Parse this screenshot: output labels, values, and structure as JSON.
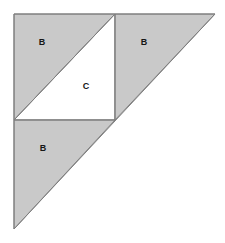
{
  "figure": {
    "type": "geometry-diagram",
    "canvas": {
      "width": 225,
      "height": 243
    },
    "colors": {
      "background": "#ffffff",
      "shaded_fill": "#c9c9c9",
      "unshaded_fill": "#ffffff",
      "stroke": "#7f7f7f",
      "label_text": "#161616"
    },
    "outer_triangle": {
      "vertices": [
        [
          14,
          14
        ],
        [
          215,
          14
        ],
        [
          14,
          229
        ]
      ],
      "right_angle_at": [
        14,
        14
      ]
    },
    "inner_square": {
      "corners": [
        [
          14,
          14
        ],
        [
          115,
          14
        ],
        [
          115,
          120
        ],
        [
          14,
          120
        ]
      ],
      "diagonal": [
        [
          14,
          120
        ],
        [
          115,
          14
        ]
      ]
    },
    "regions": [
      {
        "name": "region-b-top-left",
        "label": "B",
        "shaded": true,
        "points": "14,14 115,14 14,120",
        "label_x": 42,
        "label_y": 43
      },
      {
        "name": "region-c-center",
        "label": "C",
        "shaded": false,
        "points": "115,14 115,120 14,120",
        "label_x": 86,
        "label_y": 87
      },
      {
        "name": "region-b-right",
        "label": "B",
        "shaded": true,
        "points": "115,14 215,14 115,120",
        "label_x": 144,
        "label_y": 43
      },
      {
        "name": "region-b-bottom",
        "label": "B",
        "shaded": true,
        "points": "14,120 115,120 14,229",
        "label_x": 43,
        "label_y": 149
      }
    ],
    "edges": [
      {
        "name": "outer-top-edge",
        "from": [
          14,
          14
        ],
        "to": [
          215,
          14
        ]
      },
      {
        "name": "outer-left-edge",
        "from": [
          14,
          14
        ],
        "to": [
          14,
          229
        ]
      },
      {
        "name": "outer-hypotenuse",
        "from": [
          215,
          14
        ],
        "to": [
          14,
          229
        ]
      },
      {
        "name": "square-right-edge",
        "from": [
          115,
          14
        ],
        "to": [
          115,
          120
        ]
      },
      {
        "name": "square-bottom-edge",
        "from": [
          14,
          120
        ],
        "to": [
          115,
          120
        ]
      },
      {
        "name": "square-diagonal",
        "from": [
          14,
          120
        ],
        "to": [
          115,
          14
        ]
      }
    ]
  }
}
